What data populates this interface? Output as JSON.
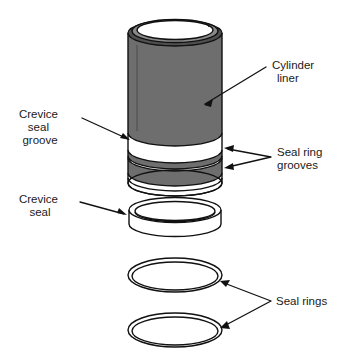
{
  "figure": {
    "background_color": "#ffffff",
    "line_color": "#111111",
    "liner_body_color": "#6e6e6e",
    "liner_rim_color": "#4f4f4f",
    "seal_color": "#ffffff"
  },
  "labels": {
    "cylinder_liner": {
      "lines": [
        "Cylinder",
        "liner"
      ],
      "line1": "Cylinder",
      "line2": "liner",
      "align": "left"
    },
    "crevice_seal_groove": {
      "lines": [
        "Crevice",
        "seal",
        "groove"
      ],
      "line1": "Crevice",
      "line2": "seal",
      "line3": "groove",
      "align": "center"
    },
    "seal_ring_grooves": {
      "lines": [
        "Seal ring",
        "grooves"
      ],
      "line1": "Seal ring",
      "line2": "grooves",
      "align": "left"
    },
    "crevice_seal": {
      "lines": [
        "Crevice",
        "seal"
      ],
      "line1": "Crevice",
      "line2": "seal",
      "align": "center"
    },
    "seal_rings": {
      "lines": [
        "Seal rings"
      ],
      "line1": "Seal rings",
      "align": "left"
    }
  },
  "parts": [
    {
      "name": "cylinder-liner",
      "label": "Cylinder liner",
      "shape": "hollow-cylinder",
      "fill": "#6e6e6e",
      "count": 1
    },
    {
      "name": "crevice-seal-groove",
      "label": "Crevice seal groove",
      "shape": "circumferential-groove",
      "fill": "#ffffff",
      "count": 1
    },
    {
      "name": "seal-ring-grooves",
      "label": "Seal ring grooves",
      "shape": "circumferential-groove",
      "fill": "#ffffff",
      "count": 2
    },
    {
      "name": "crevice-seal",
      "label": "Crevice seal",
      "shape": "band-collar",
      "fill": "#ffffff",
      "count": 1
    },
    {
      "name": "seal-rings",
      "label": "Seal rings",
      "shape": "flat-ring",
      "fill": "#ffffff",
      "count": 2
    }
  ]
}
